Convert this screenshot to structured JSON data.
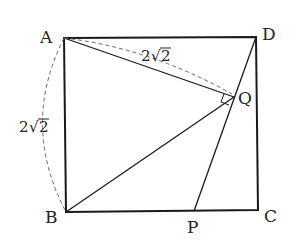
{
  "diagram": {
    "type": "geometry",
    "shape": "square ABCD with point P on BC and Q on DP",
    "points": {
      "A": {
        "label": "A",
        "x": 64,
        "y": 38
      },
      "B": {
        "label": "B",
        "x": 66,
        "y": 212
      },
      "C": {
        "label": "C",
        "x": 258,
        "y": 210
      },
      "D": {
        "label": "D",
        "x": 256,
        "y": 37
      },
      "P": {
        "label": "P",
        "x": 194,
        "y": 211
      },
      "Q": {
        "label": "Q",
        "x": 234,
        "y": 97
      }
    },
    "segments": [
      "AB",
      "BC",
      "CD",
      "DA",
      "AQ",
      "BQ",
      "DP"
    ],
    "dashed": [
      "arc AB",
      "AQ measure"
    ],
    "right_angle_at": "Q",
    "measures": {
      "AB": "2√2",
      "AQ": "2√2"
    },
    "measure_labels": {
      "ab_coef": "2",
      "ab_rad": "2",
      "aq_coef": "2",
      "aq_rad": "2"
    },
    "colors": {
      "line": "#1a1a1a",
      "dashed": "#666666"
    }
  }
}
